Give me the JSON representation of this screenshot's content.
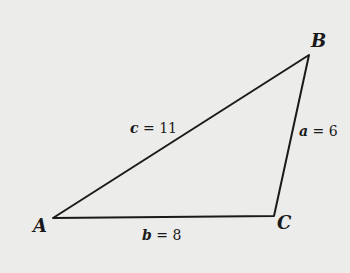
{
  "diagram": {
    "type": "triangle",
    "vertices": [
      {
        "name": "A",
        "label": "A"
      },
      {
        "name": "B",
        "label": "B"
      },
      {
        "name": "C",
        "label": "C"
      }
    ],
    "sides": [
      {
        "name": "c",
        "label": "c = 11",
        "between": "A-B",
        "length": 11
      },
      {
        "name": "a",
        "label": "a = 6",
        "between": "B-C",
        "length": 6
      },
      {
        "name": "b",
        "label": "b = 8",
        "between": "A-C",
        "length": 8
      }
    ],
    "colors": {
      "background": "#ececea",
      "stroke": "#1a1a1a"
    }
  }
}
